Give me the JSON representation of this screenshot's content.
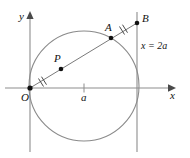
{
  "figure": {
    "type": "geometry-diagram",
    "background_color": "#ffffff",
    "stroke_color": "#6b6b6b",
    "axis_color": "#8a8a8a",
    "label_color": "#111111",
    "point_color": "#1a1a1a"
  },
  "axes": {
    "x_axis": {
      "label": "x",
      "arrow": true
    },
    "y_axis": {
      "label": "y",
      "arrow": true
    },
    "origin_label": "O",
    "x_tick_label": "a"
  },
  "labels": {
    "point_O": "O",
    "point_P": "P",
    "point_A": "A",
    "point_B": "B",
    "tick_a": "a",
    "axis_x": "x",
    "axis_y": "y",
    "vertical_line": "x = 2a"
  },
  "points": [
    {
      "name": "O",
      "label": "O",
      "x": 30,
      "y": 88
    },
    {
      "name": "P",
      "label": "P",
      "x": 61,
      "y": 69
    },
    {
      "name": "A",
      "label": "A",
      "x": 111,
      "y": 38
    },
    {
      "name": "B",
      "label": "B",
      "x": 137,
      "y": 23
    }
  ],
  "shapes": {
    "circle": {
      "center_x": 84,
      "center_y": 86,
      "radius": 55
    },
    "secant_line": {
      "from": "O",
      "to": "B"
    },
    "vertical_line": {
      "x": 137,
      "label": "x = 2a"
    },
    "congruence_marks": [
      {
        "segment": "OP",
        "ticks": 2
      },
      {
        "segment": "AB",
        "ticks": 2
      }
    ]
  }
}
